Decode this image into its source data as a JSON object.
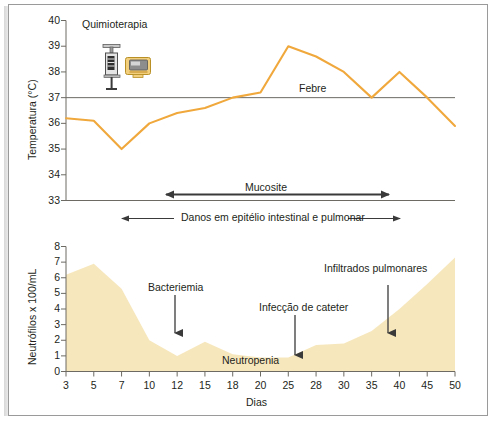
{
  "figure": {
    "title_alt": "Curso clinico da neutropenia febril",
    "background": "#ffffff",
    "frame_color": "#9a9a9a"
  },
  "colors": {
    "temperature_line": "#f0a83c",
    "neutrophil_fill": "#f7e7bd",
    "axis": "#6d6a63",
    "text": "#231f20",
    "arrow": "#3a3a3a"
  },
  "icons": {
    "syringe": "syringe-icon",
    "iv_pump": "iv-pump-icon"
  },
  "annotations": {
    "chemotherapy": "Quimioterapia",
    "fever": "Febre",
    "mucositis": "Mucosite",
    "epithelial_damage": "Danos em epitélio intestinal e pulmonar",
    "bacteremia": "Bacteriemia",
    "catheter_infection": "Infecção de cateter",
    "pulmonary_infiltrates": "Infiltrados pulmonares",
    "neutropenia": "Neutropenia"
  },
  "chart_data": [
    {
      "type": "line",
      "name": "temperature-chart",
      "title": "",
      "xlabel": "",
      "ylabel": "Temperatura (°C)",
      "ylim": [
        33,
        40
      ],
      "yticks": [
        33,
        34,
        35,
        36,
        37,
        38,
        39,
        40
      ],
      "ytick_labels": [
        "33",
        "34",
        "35",
        "36",
        "37",
        "38",
        "39",
        "40"
      ],
      "x": [
        3,
        5,
        7,
        10,
        12,
        15,
        18,
        20,
        25,
        28,
        30,
        35,
        40,
        45,
        50
      ],
      "values": [
        36.2,
        36.1,
        35.0,
        36.0,
        36.4,
        36.6,
        37.0,
        37.2,
        39.0,
        38.6,
        38.0,
        37.0,
        38.0,
        37.0,
        35.9
      ],
      "reference_line": {
        "y": 37,
        "label": "Febre",
        "color": "#6d6a63"
      },
      "grid": false,
      "legend": "none"
    },
    {
      "type": "area",
      "name": "neutrophil-chart",
      "title": "",
      "xlabel": "Dias",
      "ylabel": "Neutrófilos x 100/mL",
      "ylim": [
        0,
        8
      ],
      "yticks": [
        0,
        1,
        2,
        3,
        4,
        5,
        6,
        7,
        8
      ],
      "ytick_labels": [
        "0",
        "1",
        "2",
        "3",
        "4",
        "5",
        "6",
        "7",
        "8"
      ],
      "xticks": [
        3,
        5,
        7,
        10,
        12,
        15,
        18,
        20,
        25,
        28,
        30,
        35,
        40,
        45,
        50
      ],
      "xtick_labels": [
        "3",
        "5",
        "7",
        "10",
        "12",
        "15",
        "18",
        "20",
        "25",
        "28",
        "30",
        "35",
        "40",
        "45",
        "50"
      ],
      "x": [
        3,
        5,
        7,
        10,
        12,
        15,
        18,
        20,
        25,
        28,
        30,
        35,
        40,
        45,
        50
      ],
      "values": [
        6.2,
        6.9,
        5.3,
        2.0,
        1.0,
        1.9,
        1.1,
        0.9,
        0.9,
        1.7,
        1.8,
        2.6,
        4.0,
        5.6,
        7.3
      ],
      "grid": false,
      "legend": "none"
    }
  ],
  "markers": {
    "mucositis_span": {
      "from_day": 12,
      "to_day": 40,
      "label": "Mucosite"
    },
    "epithelial_span": {
      "from_day": 9,
      "to_day": 43,
      "label": "Danos em epitélio intestinal e pulmonar"
    },
    "bacteremia_arrow": {
      "day": 12,
      "label": "Bacteriemia"
    },
    "catheter_arrow": {
      "day": 25,
      "label": "Infecção de cateter"
    },
    "infiltrates_arrow": {
      "day": 37,
      "label": "Infiltrados pulmonares"
    },
    "chemo_marker": {
      "day": 5,
      "label": "Quimioterapia"
    }
  }
}
